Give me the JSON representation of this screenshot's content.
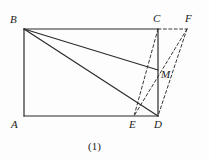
{
  "figure": {
    "caption": "(1)",
    "stroke_color": "#2b2b2b",
    "dash_color": "#3a3a3a",
    "background": "#fdfdfd",
    "vertices": [
      {
        "name": "A",
        "label": "A",
        "x": 24,
        "y": 116,
        "label_x": 11,
        "label_y": 119
      },
      {
        "name": "B",
        "label": "B",
        "x": 24,
        "y": 29,
        "label_x": 10,
        "label_y": 14
      },
      {
        "name": "C",
        "label": "C",
        "x": 158,
        "y": 29,
        "label_x": 153,
        "label_y": 13
      },
      {
        "name": "D",
        "label": "D",
        "x": 158,
        "y": 116,
        "label_x": 154,
        "label_y": 119
      },
      {
        "name": "E",
        "label": "E",
        "x": 134,
        "y": 116,
        "label_x": 129,
        "label_y": 119
      },
      {
        "name": "F",
        "label": "F",
        "x": 187,
        "y": 29,
        "label_x": 185,
        "label_y": 13
      },
      {
        "name": "M",
        "label": "M",
        "x": 158,
        "y": 70,
        "label_x": 161,
        "label_y": 69
      }
    ],
    "solid_segments": [
      {
        "name": "segment-AB",
        "from": "A",
        "to": "B"
      },
      {
        "name": "segment-BC",
        "from": "B",
        "to": "C"
      },
      {
        "name": "segment-CD",
        "from": "C",
        "to": "D"
      },
      {
        "name": "segment-AD",
        "from": "A",
        "to": "D"
      },
      {
        "name": "segment-BM",
        "from": "B",
        "to": "M"
      },
      {
        "name": "segment-BD",
        "from": "B",
        "to": "D"
      }
    ],
    "dashed_segments": [
      {
        "name": "segment-CE",
        "from": "C",
        "to": "E"
      },
      {
        "name": "segment-CF",
        "from": "C",
        "to": "F"
      },
      {
        "name": "segment-FE",
        "from": "F",
        "to": "E"
      },
      {
        "name": "segment-FD",
        "from": "F",
        "to": "D"
      }
    ],
    "caption_x": 88,
    "caption_y": 141
  }
}
